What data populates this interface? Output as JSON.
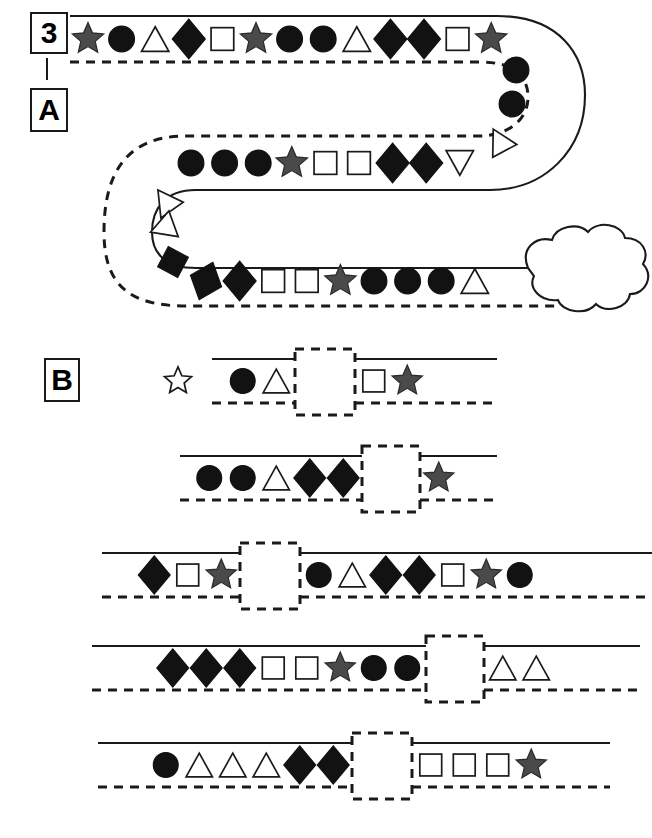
{
  "figure": {
    "labels": {
      "number": "3",
      "panel_a": "A",
      "panel_b": "B"
    },
    "colors": {
      "line": "#1a1a1a",
      "filled_shape": "#121212",
      "star_gray": "#4a4a4a",
      "outline_fill": "#ffffff",
      "background": "#ffffff"
    }
  },
  "panel_a": {
    "name": "A",
    "description": "serpentine track with shape sequence ending at a cloud",
    "segments": [
      {
        "name": "top-row",
        "direction": "left-to-right",
        "shapes": [
          {
            "type": "star",
            "fill": "gray"
          },
          {
            "type": "circle",
            "fill": "black"
          },
          {
            "type": "triangle",
            "fill": "white"
          },
          {
            "type": "diamond",
            "fill": "black"
          },
          {
            "type": "square",
            "fill": "white"
          },
          {
            "type": "star",
            "fill": "gray"
          },
          {
            "type": "circle",
            "fill": "black"
          },
          {
            "type": "circle",
            "fill": "black"
          },
          {
            "type": "triangle",
            "fill": "white"
          },
          {
            "type": "diamond",
            "fill": "black"
          },
          {
            "type": "diamond",
            "fill": "black"
          },
          {
            "type": "square",
            "fill": "white"
          },
          {
            "type": "star",
            "fill": "gray"
          }
        ]
      },
      {
        "name": "right-curve",
        "direction": "curving-down",
        "shapes": [
          {
            "type": "circle",
            "fill": "black"
          },
          {
            "type": "circle",
            "fill": "black"
          },
          {
            "type": "triangle",
            "fill": "white"
          }
        ]
      },
      {
        "name": "middle-row",
        "direction": "right-to-left",
        "shapes": [
          {
            "type": "circle",
            "fill": "black"
          },
          {
            "type": "circle",
            "fill": "black"
          },
          {
            "type": "circle",
            "fill": "black"
          },
          {
            "type": "star",
            "fill": "gray"
          },
          {
            "type": "square",
            "fill": "white"
          },
          {
            "type": "square",
            "fill": "white"
          },
          {
            "type": "diamond",
            "fill": "black"
          },
          {
            "type": "diamond",
            "fill": "black"
          },
          {
            "type": "triangle",
            "fill": "white"
          }
        ]
      },
      {
        "name": "left-curve",
        "direction": "curving-down",
        "shapes": [
          {
            "type": "triangle",
            "fill": "white"
          },
          {
            "type": "triangle",
            "fill": "white"
          },
          {
            "type": "square",
            "fill": "black"
          }
        ]
      },
      {
        "name": "bottom-row",
        "direction": "left-to-right",
        "shapes": [
          {
            "type": "diamond",
            "fill": "black"
          },
          {
            "type": "diamond",
            "fill": "black"
          },
          {
            "type": "square",
            "fill": "white"
          },
          {
            "type": "square",
            "fill": "white"
          },
          {
            "type": "star",
            "fill": "gray"
          },
          {
            "type": "circle",
            "fill": "black"
          },
          {
            "type": "circle",
            "fill": "black"
          },
          {
            "type": "circle",
            "fill": "black"
          },
          {
            "type": "triangle",
            "fill": "white"
          }
        ]
      }
    ],
    "endpoint": {
      "type": "cloud",
      "fill": "white"
    }
  },
  "panel_b": {
    "name": "B",
    "description": "five straight track rows each containing a dashed gap box",
    "marker": {
      "type": "star",
      "fill": "white",
      "name": "outline-star-marker"
    },
    "rows": [
      {
        "index": 1,
        "before_gap": [
          {
            "type": "circle",
            "fill": "black"
          },
          {
            "type": "triangle",
            "fill": "white"
          }
        ],
        "gap": true,
        "after_gap": [
          {
            "type": "square",
            "fill": "white"
          },
          {
            "type": "star",
            "fill": "gray"
          }
        ]
      },
      {
        "index": 2,
        "before_gap": [
          {
            "type": "circle",
            "fill": "black"
          },
          {
            "type": "circle",
            "fill": "black"
          },
          {
            "type": "triangle",
            "fill": "white"
          },
          {
            "type": "diamond",
            "fill": "black"
          },
          {
            "type": "diamond",
            "fill": "black"
          }
        ],
        "gap": true,
        "after_gap": [
          {
            "type": "star",
            "fill": "gray"
          }
        ]
      },
      {
        "index": 3,
        "before_gap": [
          {
            "type": "diamond",
            "fill": "black"
          },
          {
            "type": "square",
            "fill": "white"
          },
          {
            "type": "star",
            "fill": "gray"
          }
        ],
        "gap": true,
        "after_gap": [
          {
            "type": "circle",
            "fill": "black"
          },
          {
            "type": "triangle",
            "fill": "white"
          },
          {
            "type": "diamond",
            "fill": "black"
          },
          {
            "type": "diamond",
            "fill": "black"
          },
          {
            "type": "square",
            "fill": "white"
          },
          {
            "type": "star",
            "fill": "gray"
          },
          {
            "type": "circle",
            "fill": "black"
          }
        ]
      },
      {
        "index": 4,
        "before_gap": [
          {
            "type": "diamond",
            "fill": "black"
          },
          {
            "type": "diamond",
            "fill": "black"
          },
          {
            "type": "diamond",
            "fill": "black"
          },
          {
            "type": "square",
            "fill": "white"
          },
          {
            "type": "square",
            "fill": "white"
          },
          {
            "type": "star",
            "fill": "gray"
          },
          {
            "type": "circle",
            "fill": "black"
          },
          {
            "type": "circle",
            "fill": "black"
          }
        ],
        "gap": true,
        "after_gap": [
          {
            "type": "triangle",
            "fill": "white"
          },
          {
            "type": "triangle",
            "fill": "white"
          }
        ]
      },
      {
        "index": 5,
        "before_gap": [
          {
            "type": "circle",
            "fill": "black"
          },
          {
            "type": "triangle",
            "fill": "white"
          },
          {
            "type": "triangle",
            "fill": "white"
          },
          {
            "type": "triangle",
            "fill": "white"
          },
          {
            "type": "diamond",
            "fill": "black"
          },
          {
            "type": "diamond",
            "fill": "black"
          }
        ],
        "gap": true,
        "after_gap": [
          {
            "type": "square",
            "fill": "white"
          },
          {
            "type": "square",
            "fill": "white"
          },
          {
            "type": "square",
            "fill": "white"
          },
          {
            "type": "star",
            "fill": "gray"
          }
        ]
      }
    ]
  }
}
